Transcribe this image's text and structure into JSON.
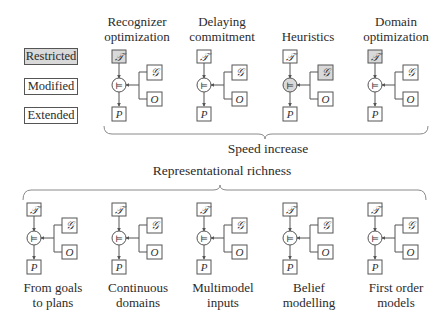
{
  "legend": [
    {
      "key": "restricted",
      "label": "Restricted",
      "fill": "#d9d9d9"
    },
    {
      "key": "modified",
      "label": "Modified",
      "fill": "#ffffff"
    },
    {
      "key": "extended",
      "label": "Extended",
      "fill": "#ffffff"
    }
  ],
  "node_symbols": {
    "theory": "𝒯",
    "goal": "𝒢",
    "observations": "O",
    "plan": "P",
    "entailment": "⊨"
  },
  "colors": {
    "stroke": "#555555",
    "highlight_fill": "#d9d9d9",
    "bracket": "#8a8a8a"
  },
  "top_row": {
    "axis_label": "Speed increase",
    "blocks": [
      {
        "label_line1": "Recognizer",
        "label_line2": "optimization",
        "highlight": [
          "theory"
        ]
      },
      {
        "label_line1": "Delaying",
        "label_line2": "commitment",
        "highlight": []
      },
      {
        "label_line1": "",
        "label_line2": "Heuristics",
        "highlight": [
          "entailment",
          "goal"
        ]
      },
      {
        "label_line1": "Domain",
        "label_line2": "optimization",
        "highlight": [
          "theory"
        ]
      }
    ]
  },
  "bottom_row": {
    "axis_label": "Representational richness",
    "blocks": [
      {
        "label_line1": "From goals",
        "label_line2": "to plans",
        "highlight": []
      },
      {
        "label_line1": "Continuous",
        "label_line2": "domains",
        "highlight": []
      },
      {
        "label_line1": "Multimodel",
        "label_line2": "inputs",
        "highlight": []
      },
      {
        "label_line1": "Belief",
        "label_line2": "modelling",
        "highlight": []
      },
      {
        "label_line1": "First order",
        "label_line2": "models",
        "highlight": []
      }
    ]
  }
}
